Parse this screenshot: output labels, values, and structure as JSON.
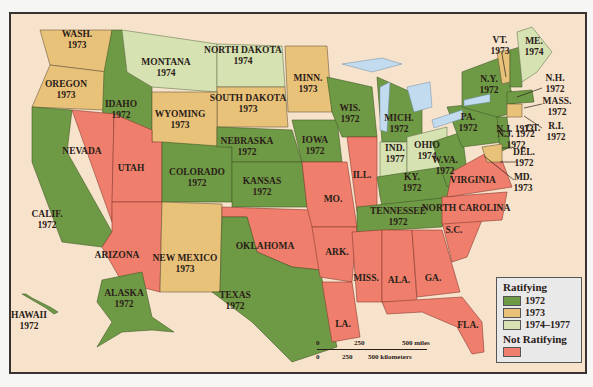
{
  "colors": {
    "y1972": "#6f9a45",
    "y1973": "#e9c27a",
    "y1974_1977": "#d6e2b2",
    "not_ratifying": "#ef7f6c",
    "background": "#f7e3cc",
    "water": "#c3dbee"
  },
  "states": [
    {
      "name": "WASH.",
      "year": "1973",
      "x": 75,
      "y": 38
    },
    {
      "name": "OREGON",
      "year": "1973",
      "x": 64,
      "y": 88
    },
    {
      "name": "IDAHO",
      "year": "1972",
      "x": 119,
      "y": 108
    },
    {
      "name": "MONTANA",
      "year": "1974",
      "x": 164,
      "y": 66
    },
    {
      "name": "NORTH DAKOTA",
      "year": "1974",
      "x": 241,
      "y": 54
    },
    {
      "name": "SOUTH DAKOTA",
      "year": "1973",
      "x": 246,
      "y": 102
    },
    {
      "name": "WYOMING",
      "year": "1973",
      "x": 178,
      "y": 118
    },
    {
      "name": "MINN.",
      "year": "1973",
      "x": 306,
      "y": 82
    },
    {
      "name": "WIS.",
      "year": "1972",
      "x": 348,
      "y": 112
    },
    {
      "name": "MICH.",
      "year": "1972",
      "x": 397,
      "y": 122
    },
    {
      "name": "NEBRASKA",
      "year": "1972",
      "x": 245,
      "y": 145
    },
    {
      "name": "IOWA",
      "year": "1972",
      "x": 313,
      "y": 144
    },
    {
      "name": "COLORADO",
      "year": "1972",
      "x": 195,
      "y": 176
    },
    {
      "name": "KANSAS",
      "year": "1972",
      "x": 260,
      "y": 185
    },
    {
      "name": "NEVADA",
      "year": "",
      "x": 80,
      "y": 149
    },
    {
      "name": "UTAH",
      "year": "",
      "x": 129,
      "y": 166
    },
    {
      "name": "CALIF.",
      "year": "1972",
      "x": 45,
      "y": 218
    },
    {
      "name": "ARIZONA",
      "year": "",
      "x": 115,
      "y": 253
    },
    {
      "name": "NEW MEXICO",
      "year": "1973",
      "x": 183,
      "y": 262
    },
    {
      "name": "OKLAHOMA",
      "year": "",
      "x": 263,
      "y": 244
    },
    {
      "name": "TEXAS",
      "year": "1972",
      "x": 233,
      "y": 299
    },
    {
      "name": "MO.",
      "year": "",
      "x": 331,
      "y": 197
    },
    {
      "name": "ILL.",
      "year": "",
      "x": 360,
      "y": 173
    },
    {
      "name": "ARK.",
      "year": "",
      "x": 335,
      "y": 250
    },
    {
      "name": "LA.",
      "year": "",
      "x": 341,
      "y": 322
    },
    {
      "name": "MISS.",
      "year": "",
      "x": 364,
      "y": 276
    },
    {
      "name": "ALA.",
      "year": "",
      "x": 397,
      "y": 278
    },
    {
      "name": "GA.",
      "year": "",
      "x": 431,
      "y": 276
    },
    {
      "name": "FLA.",
      "year": "",
      "x": 466,
      "y": 323
    },
    {
      "name": "S.C.",
      "year": "",
      "x": 452,
      "y": 228
    },
    {
      "name": "NORTH CAROLINA",
      "year": "",
      "x": 464,
      "y": 206
    },
    {
      "name": "VIRGINIA",
      "year": "",
      "x": 471,
      "y": 178
    },
    {
      "name": "TENNESSEE",
      "year": "1972",
      "x": 396,
      "y": 215
    },
    {
      "name": "KY.",
      "year": "1972",
      "x": 410,
      "y": 181
    },
    {
      "name": "W.VA.",
      "year": "1972",
      "x": 443,
      "y": 164
    },
    {
      "name": "IND.",
      "year": "1977",
      "x": 393,
      "y": 152
    },
    {
      "name": "OHIO",
      "year": "1974",
      "x": 425,
      "y": 149
    },
    {
      "name": "PA.",
      "year": "1972",
      "x": 466,
      "y": 121
    },
    {
      "name": "N.Y.",
      "year": "1972",
      "x": 487,
      "y": 83
    },
    {
      "name": "VT.",
      "year": "1973",
      "x": 498,
      "y": 44
    },
    {
      "name": "ME.",
      "year": "1974",
      "x": 532,
      "y": 45
    },
    {
      "name": "N.H.",
      "year": "1972",
      "x": 553,
      "y": 82
    },
    {
      "name": "MASS.",
      "year": "1972",
      "x": 555,
      "y": 105
    },
    {
      "name": "R.I.",
      "year": "1972",
      "x": 554,
      "y": 130
    },
    {
      "name": "CT.",
      "year": "",
      "x": 531,
      "y": 126
    },
    {
      "name": "N.J. 1973",
      "year": "",
      "x": 513,
      "y": 127
    },
    {
      "name": "N.J. 1972",
      "year": "1972",
      "x": 514,
      "y": 138
    },
    {
      "name": "DEL.",
      "year": "1972",
      "x": 522,
      "y": 156
    },
    {
      "name": "MD.",
      "year": "1973",
      "x": 521,
      "y": 181
    },
    {
      "name": "ALASKA",
      "year": "1972",
      "x": 122,
      "y": 297
    },
    {
      "name": "HAWAII",
      "year": "1972",
      "x": 27,
      "y": 319
    }
  ],
  "legend": {
    "ratifying_title": "Ratifying",
    "items": [
      {
        "label": "1972"
      },
      {
        "label": "1973"
      },
      {
        "label": "1974–1977"
      }
    ],
    "not_ratifying_title": "Not Ratifying"
  },
  "scale": {
    "miles": [
      "0",
      "250",
      "500 miles"
    ],
    "km": [
      "0",
      "250",
      "500 kilometers"
    ]
  }
}
